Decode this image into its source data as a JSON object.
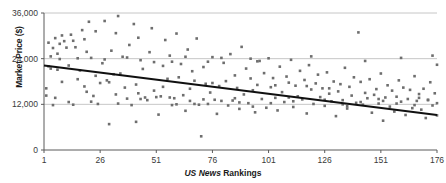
{
  "chart_data": {
    "type": "scatter",
    "title": "",
    "xlabel_parts": {
      "emphasis": "US News",
      "rest": "Rankings"
    },
    "xlabel": "US News Rankings",
    "ylabel": "Market Price ($)",
    "xlim": [
      1,
      176
    ],
    "ylim": [
      0,
      36000
    ],
    "xticks": [
      1,
      26,
      51,
      76,
      101,
      126,
      151,
      176
    ],
    "xtick_labels": [
      "1",
      "26",
      "51",
      "76",
      "101",
      "126",
      "151",
      "176"
    ],
    "yticks": [
      0,
      12000,
      24000,
      36000
    ],
    "ytick_labels": [
      "0",
      "12,000",
      "24,000",
      "36,000"
    ],
    "grid": "horizontal",
    "legend": "none",
    "marker": {
      "shape": "square",
      "size_px": 2.6,
      "color": "#6e6e6e"
    },
    "trendline": {
      "type": "linear",
      "color": "#101010",
      "width_px": 2.2,
      "x_start": 1,
      "y_start": 22200,
      "x_end": 176,
      "y_end": 9200
    },
    "points": [
      [
        2,
        16200
      ],
      [
        2,
        14300
      ],
      [
        3,
        28200
      ],
      [
        3,
        22000
      ],
      [
        4,
        21400
      ],
      [
        5,
        26800
      ],
      [
        5,
        11800
      ],
      [
        6,
        29400
      ],
      [
        7,
        25300
      ],
      [
        7,
        21100
      ],
      [
        8,
        27900
      ],
      [
        9,
        30100
      ],
      [
        9,
        17900
      ],
      [
        10,
        28600
      ],
      [
        11,
        26900
      ],
      [
        12,
        22200
      ],
      [
        13,
        30300
      ],
      [
        14,
        28700
      ],
      [
        15,
        27000
      ],
      [
        16,
        18600
      ],
      [
        17,
        20900
      ],
      [
        18,
        31500
      ],
      [
        19,
        29100
      ],
      [
        19,
        16700
      ],
      [
        20,
        25800
      ],
      [
        21,
        33700
      ],
      [
        22,
        24200
      ],
      [
        23,
        14200
      ],
      [
        24,
        31200
      ],
      [
        25,
        12100
      ],
      [
        26,
        17600
      ],
      [
        27,
        22800
      ],
      [
        28,
        33900
      ],
      [
        29,
        18300
      ],
      [
        30,
        6800
      ],
      [
        31,
        26100
      ],
      [
        32,
        19900
      ],
      [
        33,
        30700
      ],
      [
        33,
        14600
      ],
      [
        34,
        35200
      ],
      [
        35,
        20100
      ],
      [
        36,
        24500
      ],
      [
        37,
        16400
      ],
      [
        38,
        13500
      ],
      [
        39,
        27600
      ],
      [
        40,
        11800
      ],
      [
        41,
        33100
      ],
      [
        42,
        17200
      ],
      [
        43,
        29500
      ],
      [
        43,
        14900
      ],
      [
        44,
        13400
      ],
      [
        45,
        21300
      ],
      [
        46,
        13800
      ],
      [
        47,
        13100
      ],
      [
        48,
        25700
      ],
      [
        49,
        32000
      ],
      [
        50,
        15600
      ],
      [
        51,
        13900
      ],
      [
        52,
        9300
      ],
      [
        53,
        14100
      ],
      [
        54,
        22100
      ],
      [
        55,
        28900
      ],
      [
        56,
        18700
      ],
      [
        57,
        24800
      ],
      [
        57,
        13800
      ],
      [
        58,
        11800
      ],
      [
        59,
        13600
      ],
      [
        60,
        30600
      ],
      [
        61,
        19100
      ],
      [
        62,
        22600
      ],
      [
        63,
        14400
      ],
      [
        64,
        10300
      ],
      [
        65,
        26400
      ],
      [
        66,
        16100
      ],
      [
        67,
        20700
      ],
      [
        68,
        12100
      ],
      [
        69,
        29300
      ],
      [
        70,
        11900
      ],
      [
        71,
        3600
      ],
      [
        72,
        21800
      ],
      [
        73,
        17400
      ],
      [
        74,
        23200
      ],
      [
        75,
        15100
      ],
      [
        76,
        24400
      ],
      [
        76,
        17600
      ],
      [
        77,
        13200
      ],
      [
        78,
        9500
      ],
      [
        79,
        16800
      ],
      [
        80,
        12900
      ],
      [
        81,
        22900
      ],
      [
        82,
        18100
      ],
      [
        83,
        11700
      ],
      [
        84,
        25200
      ],
      [
        85,
        13000
      ],
      [
        86,
        19600
      ],
      [
        87,
        16300
      ],
      [
        88,
        10800
      ],
      [
        89,
        27100
      ],
      [
        90,
        14600
      ],
      [
        91,
        21400
      ],
      [
        92,
        12300
      ],
      [
        93,
        24000
      ],
      [
        93,
        18800
      ],
      [
        94,
        15700
      ],
      [
        95,
        9900
      ],
      [
        96,
        17100
      ],
      [
        97,
        23400
      ],
      [
        98,
        13400
      ],
      [
        99,
        20200
      ],
      [
        100,
        11100
      ],
      [
        101,
        24100
      ],
      [
        102,
        16500
      ],
      [
        103,
        18900
      ],
      [
        104,
        13700
      ],
      [
        105,
        10400
      ],
      [
        106,
        21900
      ],
      [
        107,
        15200
      ],
      [
        108,
        12600
      ],
      [
        109,
        19300
      ],
      [
        110,
        17700
      ],
      [
        111,
        23700
      ],
      [
        112,
        11300
      ],
      [
        113,
        16900
      ],
      [
        114,
        14100
      ],
      [
        115,
        20800
      ],
      [
        116,
        13300
      ],
      [
        117,
        18400
      ],
      [
        118,
        9600
      ],
      [
        119,
        22300
      ],
      [
        120,
        15900
      ],
      [
        121,
        12100
      ],
      [
        122,
        17500
      ],
      [
        123,
        19800
      ],
      [
        124,
        13900
      ],
      [
        125,
        16200
      ],
      [
        126,
        11600
      ],
      [
        127,
        20400
      ],
      [
        128,
        14800
      ],
      [
        129,
        12800
      ],
      [
        130,
        18000
      ],
      [
        131,
        8900
      ],
      [
        132,
        15400
      ],
      [
        133,
        17300
      ],
      [
        134,
        13100
      ],
      [
        135,
        21600
      ],
      [
        136,
        10900
      ],
      [
        137,
        16600
      ],
      [
        138,
        14300
      ],
      [
        139,
        19100
      ],
      [
        140,
        12400
      ],
      [
        141,
        30900
      ],
      [
        142,
        17900
      ],
      [
        143,
        11900
      ],
      [
        144,
        15000
      ],
      [
        145,
        13600
      ],
      [
        146,
        18600
      ],
      [
        147,
        9800
      ],
      [
        148,
        14500
      ],
      [
        149,
        16000
      ],
      [
        150,
        12200
      ],
      [
        151,
        20100
      ],
      [
        152,
        7700
      ],
      [
        153,
        13800
      ],
      [
        154,
        17000
      ],
      [
        155,
        11400
      ],
      [
        156,
        15600
      ],
      [
        157,
        10100
      ],
      [
        158,
        14000
      ],
      [
        159,
        18300
      ],
      [
        160,
        12700
      ],
      [
        161,
        16400
      ],
      [
        162,
        9200
      ],
      [
        163,
        13400
      ],
      [
        164,
        15800
      ],
      [
        165,
        11000
      ],
      [
        166,
        19400
      ],
      [
        167,
        12900
      ],
      [
        168,
        14700
      ],
      [
        169,
        10600
      ],
      [
        170,
        16100
      ],
      [
        171,
        8400
      ],
      [
        172,
        13200
      ],
      [
        173,
        17800
      ],
      [
        174,
        11700
      ],
      [
        175,
        14900
      ],
      [
        176,
        22400
      ],
      [
        176,
        12300
      ],
      [
        176,
        9100
      ],
      [
        4,
        24600
      ],
      [
        8,
        23900
      ],
      [
        12,
        12600
      ],
      [
        16,
        24100
      ],
      [
        20,
        15300
      ],
      [
        24,
        19500
      ],
      [
        28,
        23800
      ],
      [
        34,
        12200
      ],
      [
        38,
        24300
      ],
      [
        42,
        7400
      ],
      [
        50,
        23100
      ],
      [
        54,
        16600
      ],
      [
        60,
        12000
      ],
      [
        64,
        24500
      ],
      [
        68,
        18200
      ],
      [
        72,
        13300
      ],
      [
        80,
        24200
      ],
      [
        88,
        12500
      ],
      [
        96,
        23300
      ],
      [
        104,
        17000
      ],
      [
        112,
        12800
      ],
      [
        120,
        24600
      ],
      [
        128,
        16200
      ],
      [
        136,
        11500
      ],
      [
        144,
        23400
      ],
      [
        152,
        12900
      ],
      [
        160,
        24200
      ],
      [
        168,
        13700
      ],
      [
        174,
        24800
      ],
      [
        6,
        13700
      ],
      [
        14,
        11900
      ],
      [
        22,
        12700
      ],
      [
        30,
        17800
      ],
      [
        44,
        23600
      ],
      [
        58,
        23200
      ],
      [
        66,
        12900
      ],
      [
        74,
        12100
      ],
      [
        86,
        13600
      ],
      [
        94,
        11400
      ],
      [
        102,
        12300
      ],
      [
        110,
        13800
      ],
      [
        118,
        16800
      ],
      [
        126,
        13200
      ],
      [
        134,
        12000
      ],
      [
        142,
        12600
      ],
      [
        150,
        13400
      ],
      [
        158,
        12200
      ],
      [
        166,
        11800
      ],
      [
        172,
        13100
      ]
    ]
  }
}
